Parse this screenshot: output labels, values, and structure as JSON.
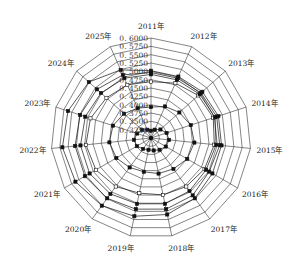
{
  "chart_data": {
    "type": "radar",
    "title": "",
    "categories": [
      "2011年",
      "2012年",
      "2013年",
      "2014年",
      "2015年",
      "2016年",
      "2017年",
      "2018年",
      "2019年",
      "2020年",
      "2021年",
      "2022年",
      "2023年",
      "2024年",
      "2025年"
    ],
    "tick_labels": [
      "0.3250",
      "0.3500",
      "0.3750",
      "0.4000",
      "0.4250",
      "0.4500",
      "0.4750",
      "0.5000",
      "0.5250",
      "0.5500",
      "0.5750",
      "0.6000"
    ],
    "rlim": [
      0.325,
      0.6
    ],
    "grid": true,
    "legend": null,
    "series": [
      {
        "name": "series-1",
        "marker": "filled-square",
        "values": [
          0.345,
          0.35,
          0.36,
          0.37,
          0.375,
          0.372,
          0.365,
          0.36,
          0.358,
          0.362,
          0.37,
          0.372,
          0.365,
          0.358,
          0.35
        ]
      },
      {
        "name": "series-2",
        "marker": "filled-square",
        "values": [
          0.41,
          0.42,
          0.43,
          0.44,
          0.445,
          0.44,
          0.43,
          0.425,
          0.42,
          0.425,
          0.435,
          0.44,
          0.435,
          0.425,
          0.415
        ]
      },
      {
        "name": "series-3",
        "marker": "open-square",
        "values": [
          0.48,
          0.49,
          0.5,
          0.505,
          0.5,
          0.495,
          0.49,
          0.485,
          0.48,
          0.49,
          0.5,
          0.505,
          0.5,
          0.49,
          0.485
        ]
      },
      {
        "name": "series-4",
        "marker": "filled-square",
        "values": [
          0.5,
          0.5,
          0.505,
          0.51,
          0.505,
          0.5,
          0.505,
          0.51,
          0.51,
          0.515,
          0.52,
          0.52,
          0.515,
          0.51,
          0.505
        ]
      },
      {
        "name": "series-5",
        "marker": "filled-square",
        "values": [
          0.505,
          0.505,
          0.51,
          0.515,
          0.515,
          0.51,
          0.52,
          0.525,
          0.525,
          0.53,
          0.535,
          0.535,
          0.53,
          0.525,
          0.515
        ]
      },
      {
        "name": "series-6",
        "marker": "filled-square",
        "values": [
          0.51,
          0.51,
          0.515,
          0.52,
          0.52,
          0.52,
          0.53,
          0.54,
          0.545,
          0.555,
          0.565,
          0.57,
          0.565,
          0.555,
          0.53
        ]
      }
    ]
  }
}
